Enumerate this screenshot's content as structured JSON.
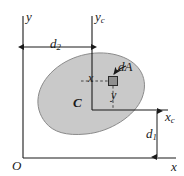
{
  "figure": {
    "type": "engineering-mechanics-diagram",
    "colors": {
      "line": "#1a1a1a",
      "region_fill": "#c9c9c9",
      "region_stroke": "#7a7a7a",
      "element_fill": "#8f8f8f",
      "element_stroke": "#2a2a2a",
      "dashed": "#3a3a3a",
      "background": "#ffffff"
    },
    "labels": {
      "y_axis": "y",
      "yc_axis_main": "y",
      "yc_axis_sub": "c",
      "xc_axis_main": "x",
      "xc_axis_sub": "c",
      "x_axis": "x",
      "origin": "O",
      "centroid": "C",
      "area_element": "dA",
      "x_distance": "x",
      "y_distance": "y",
      "d1_main": "d",
      "d1_sub": "1",
      "d2_main": "d",
      "d2_sub": "2"
    },
    "geometry": {
      "origin_point": [
        23,
        158
      ],
      "yc_axis_x": 92,
      "xc_axis_y": 110,
      "d2_dimension_y": 47,
      "d1_dimension_x": 157,
      "element_center": [
        113,
        81
      ],
      "element_size": 9,
      "region_center": [
        92,
        100
      ],
      "region_rx": 58,
      "region_ry": 36,
      "region_rotation_deg": -35
    }
  }
}
